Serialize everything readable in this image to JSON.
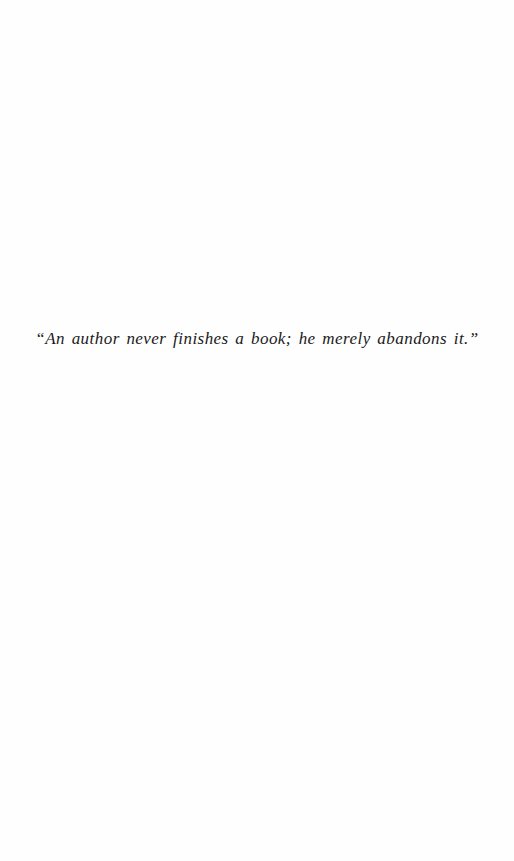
{
  "page": {
    "background_color": "#fefefe",
    "epigraph": {
      "text": "“An author never finishes a book; he merely abandons it.”",
      "color": "#1a1a1a"
    }
  }
}
